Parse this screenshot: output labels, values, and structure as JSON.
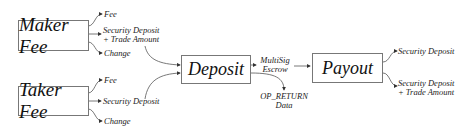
{
  "nodes": {
    "maker_fee": "Maker Fee",
    "taker_fee": "Taker Fee",
    "deposit": "Deposit",
    "payout": "Payout"
  },
  "maker_outputs": {
    "fee": "Fee",
    "security_deposit_line1": "Security Deposit",
    "security_deposit_line2": "+ Trade Amount",
    "change": "Change"
  },
  "taker_outputs": {
    "fee": "Fee",
    "security_deposit": "Security Deposit",
    "change": "Change"
  },
  "deposit_outputs": {
    "multisig_line1": "MultiSig",
    "multisig_line2": "Escrow",
    "op_return_line1": "OP_RETURN",
    "op_return_line2": "Data"
  },
  "payout_outputs": {
    "security_deposit": "Security Deposit",
    "security_trade_line1": "Security Deposit",
    "security_trade_line2": "+ Trade Amount"
  }
}
